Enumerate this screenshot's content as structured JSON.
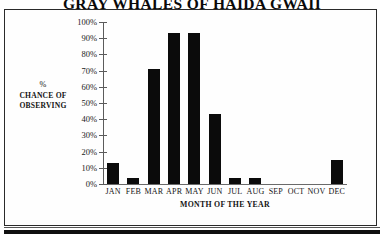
{
  "chart_data": {
    "type": "bar",
    "title": "GRAY WHALES OF HAIDA GWAII",
    "xlabel": "MONTH OF THE YEAR",
    "ylabel_lines": [
      "%",
      "CHANCE OF",
      "OBSERVING"
    ],
    "ylabel": "% CHANCE OF OBSERVING",
    "categories": [
      "JAN",
      "FEB",
      "MAR",
      "APR",
      "MAY",
      "JUN",
      "JUL",
      "AUG",
      "SEP",
      "OCT",
      "NOV",
      "DEC"
    ],
    "values": [
      13,
      4,
      71,
      93,
      93,
      43,
      4,
      4,
      0,
      0,
      0,
      15
    ],
    "ylim": [
      0,
      100
    ],
    "ytick_values": [
      0,
      10,
      20,
      30,
      40,
      50,
      60,
      70,
      80,
      90,
      100
    ],
    "ytick_labels": [
      "0%",
      "10%",
      "20%",
      "30%",
      "40%",
      "50%",
      "60%",
      "70%",
      "80%",
      "90%",
      "100%"
    ],
    "grid": false,
    "legend": "none",
    "bar_color": "#0b0b0b",
    "axis_color": "#5b5b5b",
    "background": "#ffffff"
  }
}
